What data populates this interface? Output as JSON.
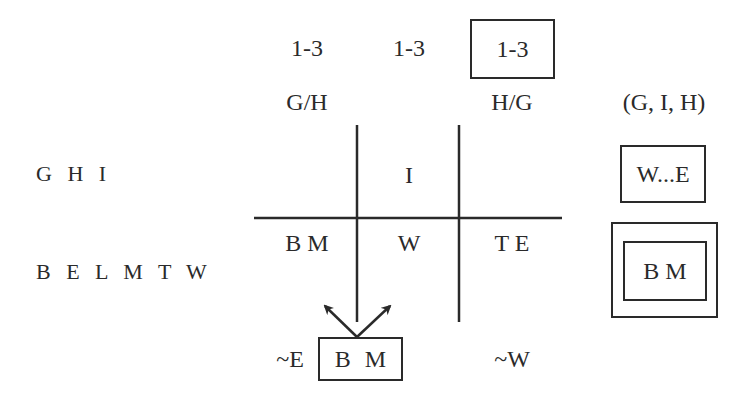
{
  "column_headers": {
    "counts": [
      "1-3",
      "1-3",
      "1-3"
    ],
    "boxed_count_index": 2,
    "orders": [
      "G/H",
      "",
      "H/G"
    ],
    "summary": "(G, I, H)"
  },
  "row_labels": [
    "G H I",
    "B E L M T W"
  ],
  "grid": {
    "top_row": [
      "",
      "I",
      ""
    ],
    "bottom_row": [
      "B M",
      "W",
      "T E"
    ]
  },
  "summary_column": {
    "row1_box": "W...E",
    "row2_double_box": "B M"
  },
  "bottom": {
    "left_constraint": "~E",
    "boxed_group": "B M",
    "right_constraint": "~W"
  },
  "colors": {
    "ink": "#2a2a2a",
    "background": "#ffffff"
  }
}
